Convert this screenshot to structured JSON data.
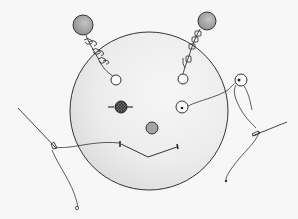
{
  "image": {
    "description": "Pencil sketch of a smiling round face with two bead antennae, a cross-stitched left eye, a button right eye, a round nose, and a stitched smile; two sewing needles with thread on either side",
    "colors": {
      "background": "#f7f7f7",
      "line": "#2e2e2e",
      "face_fill": "#f3f3f3",
      "face_shade": "#dcdcdc",
      "bead": "#9a9a9a",
      "nose": "#a3a3a3",
      "stitched_eye": "#4a4a4a"
    },
    "elements": {
      "face": "round-face",
      "left_antenna": "bead-antenna-left",
      "right_antenna": "bead-antenna-right",
      "left_eye": "stitched-eye",
      "right_eye": "button-eye",
      "nose": "round-nose",
      "mouth": "stitched-smile",
      "left_needle": "needle-with-thread-left",
      "right_needle": "needle-with-thread-right"
    }
  }
}
